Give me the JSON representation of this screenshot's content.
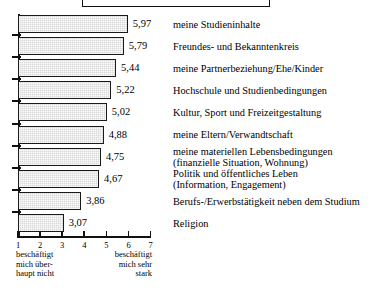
{
  "chart_data": {
    "type": "bar",
    "orientation": "horizontal",
    "title": "",
    "xlabel": "",
    "ylabel": "",
    "xlim": [
      1,
      7
    ],
    "grid": false,
    "legend": null,
    "categories": [
      "meine Studieninhalte",
      "Freundes- und Bekanntenkreis",
      "meine Partnerbeziehung/Ehe/Kinder",
      "Hochschule und Studienbedingungen",
      "Kultur, Sport und Freizeitgestaltung",
      "meine Eltern/Verwandtschaft",
      "meine materiellen Lebensbedingungen\n(finanzielle Situation, Wohnung)",
      "Politik und öffentliches Leben\n(Information, Engagement)",
      "Berufs-/Erwerbstätigkeit neben dem Studium",
      "Religion"
    ],
    "values": [
      5.97,
      5.79,
      5.44,
      5.22,
      5.02,
      4.88,
      4.75,
      4.67,
      3.86,
      3.07
    ],
    "value_labels": [
      "5,97",
      "5,79",
      "5,44",
      "5,22",
      "5,02",
      "4,88",
      "4,75",
      "4,67",
      "3,86",
      "3,07"
    ],
    "x_ticks": [
      1,
      2,
      3,
      4,
      5,
      6,
      7
    ],
    "x_tick_labels": [
      "1",
      "2",
      "3",
      "4",
      "5",
      "6",
      "7"
    ],
    "scale_anchor_low": "beschäftigt\nmich über-\nhaupt nicht",
    "scale_anchor_high": "beschäftigt\nmich sehr\nstark",
    "colors": {
      "bar_fill": "#d9d9d9",
      "bar_border": "#1a1a1a",
      "axis": "#111111",
      "text": "#000000",
      "background": "#ffffff"
    }
  }
}
